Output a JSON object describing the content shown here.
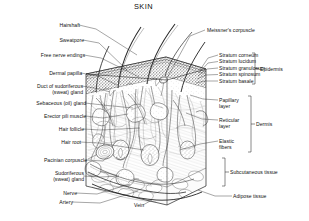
{
  "figure": {
    "title": "SKIN",
    "type": "anatomical-cross-section-diagram",
    "style": "black-and-white line drawing, stippled/hatched shading",
    "colors": {
      "background": "#ffffff",
      "ink": "#111111",
      "leader_line": "#2b2b2b",
      "shading_light": "#d8d8d8",
      "shading_mid": "#a8a8a8",
      "shading_dark": "#5a5a5a"
    }
  },
  "labels_left": [
    {
      "id": "hairshaft",
      "text": "Hairshaft"
    },
    {
      "id": "sweatpore",
      "text": "Sweatpore"
    },
    {
      "id": "free-nerve-endings",
      "text": "Free nerve endings"
    },
    {
      "id": "dermal-papilla",
      "text": "Dermal papilla"
    },
    {
      "id": "duct-sudoriferous",
      "text": "Duct of sudoriferous\n(sweat) gland"
    },
    {
      "id": "sebaceous-gland",
      "text": "Sebaceous (oil) gland"
    },
    {
      "id": "erector-pili",
      "text": "Erector pili muscle"
    },
    {
      "id": "hair-follicle",
      "text": "Hair follicle"
    },
    {
      "id": "hair-root",
      "text": "Hair root"
    },
    {
      "id": "pacinian-corpuscle",
      "text": "Pacinian corpuscle"
    },
    {
      "id": "sudoriferous-gland",
      "text": "Sudoriferous\n(sweat) gland"
    },
    {
      "id": "nerve",
      "text": "Nerve"
    },
    {
      "id": "artery",
      "text": "Artery"
    },
    {
      "id": "vein",
      "text": "Vein"
    }
  ],
  "labels_right": [
    {
      "id": "meissners-corpuscle",
      "text": "Meissner's corpuscle"
    },
    {
      "id": "stratum-corneum",
      "text": "Stratum corneum"
    },
    {
      "id": "stratum-lucidum",
      "text": "Stratum lucidum"
    },
    {
      "id": "stratum-granulosum",
      "text": "Stratum granulosum"
    },
    {
      "id": "stratum-spinosum",
      "text": "Stratum spinosum"
    },
    {
      "id": "stratum-basale",
      "text": "Stratum basale"
    },
    {
      "id": "papillary-layer",
      "text": "Papillary\nlayer"
    },
    {
      "id": "reticular-layer",
      "text": "Reticular\nlayer"
    },
    {
      "id": "elastic-fibers",
      "text": "Elastic\nfibers"
    },
    {
      "id": "adipose-tissue",
      "text": "Adipose tissue"
    }
  ],
  "brackets": [
    {
      "id": "epidermis",
      "text": "Epidermis"
    },
    {
      "id": "dermis",
      "text": "Dermis"
    },
    {
      "id": "subcutaneous-tissue",
      "text": "Subcutaneous tissue"
    }
  ]
}
